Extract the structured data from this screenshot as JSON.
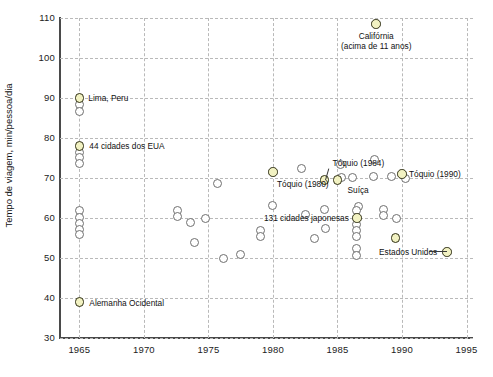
{
  "chart_data": {
    "type": "scatter",
    "title": "",
    "xlabel": "",
    "ylabel": "Tempo de viagem, min/pessoa/dia",
    "xlim": [
      1963.5,
      1995.5
    ],
    "ylim": [
      30,
      110
    ],
    "xticks": [
      1965,
      1970,
      1975,
      1980,
      1985,
      1990,
      1995
    ],
    "yticks": [
      30,
      40,
      50,
      60,
      70,
      80,
      90,
      100,
      110
    ],
    "grid": true,
    "legend": "none",
    "series": [
      {
        "name": "destacados",
        "marker": "circle-highlight",
        "color": "#f2f2c2",
        "edge_color": "#2f2f14",
        "points": [
          {
            "x": 1965.0,
            "y": 90.0,
            "label": "Lima, Peru"
          },
          {
            "x": 1965.0,
            "y": 78.0,
            "label": "44 cidades dos EUA"
          },
          {
            "x": 1965.0,
            "y": 39.0,
            "label": "Alemanha Ocidental"
          },
          {
            "x": 1988.0,
            "y": 108.5,
            "label": "Califórnia (acima de 11 anos)"
          },
          {
            "x": 1980.0,
            "y": 71.5,
            "label": "Tóquio (1980)"
          },
          {
            "x": 1984.0,
            "y": 69.5,
            "label": "Tóquio (1984)"
          },
          {
            "x": 1985.0,
            "y": 69.5,
            "label": "Suíça"
          },
          {
            "x": 1990.0,
            "y": 71.0,
            "label": "Tóquio (1990)"
          },
          {
            "x": 1986.5,
            "y": 60.0,
            "label": "131 cidades japonesas"
          },
          {
            "x": 1989.5,
            "y": 55.0,
            "label": ""
          },
          {
            "x": 1993.5,
            "y": 51.5,
            "label": "Estados Unidos"
          }
        ]
      },
      {
        "name": "demais",
        "marker": "circle-open",
        "color": "#ffffff",
        "edge_color": "#6f6f6f",
        "points": [
          {
            "x": 1965.0,
            "y": 88.3
          },
          {
            "x": 1965.0,
            "y": 86.7
          },
          {
            "x": 1965.0,
            "y": 76.5
          },
          {
            "x": 1965.0,
            "y": 75.2
          },
          {
            "x": 1965.0,
            "y": 73.6
          },
          {
            "x": 1965.0,
            "y": 61.8
          },
          {
            "x": 1965.0,
            "y": 60.2
          },
          {
            "x": 1965.0,
            "y": 58.7
          },
          {
            "x": 1965.0,
            "y": 57.2
          },
          {
            "x": 1965.0,
            "y": 55.8
          },
          {
            "x": 1972.6,
            "y": 61.9
          },
          {
            "x": 1972.6,
            "y": 60.5
          },
          {
            "x": 1973.6,
            "y": 59.0
          },
          {
            "x": 1974.8,
            "y": 59.8
          },
          {
            "x": 1973.9,
            "y": 54.0
          },
          {
            "x": 1975.7,
            "y": 68.7
          },
          {
            "x": 1976.2,
            "y": 50.0
          },
          {
            "x": 1977.5,
            "y": 51.0
          },
          {
            "x": 1979.0,
            "y": 57.0
          },
          {
            "x": 1979.0,
            "y": 55.5
          },
          {
            "x": 1980.0,
            "y": 63.2
          },
          {
            "x": 1982.2,
            "y": 72.5
          },
          {
            "x": 1982.5,
            "y": 60.8
          },
          {
            "x": 1984.0,
            "y": 62.2
          },
          {
            "x": 1984.1,
            "y": 57.3
          },
          {
            "x": 1983.2,
            "y": 54.8
          },
          {
            "x": 1985.3,
            "y": 70.2
          },
          {
            "x": 1986.2,
            "y": 70.2
          },
          {
            "x": 1985.2,
            "y": 73.3
          },
          {
            "x": 1986.6,
            "y": 63.0
          },
          {
            "x": 1986.5,
            "y": 62.0
          },
          {
            "x": 1986.5,
            "y": 58.4
          },
          {
            "x": 1986.5,
            "y": 57.0
          },
          {
            "x": 1986.5,
            "y": 55.5
          },
          {
            "x": 1986.5,
            "y": 52.3
          },
          {
            "x": 1986.5,
            "y": 50.6
          },
          {
            "x": 1987.8,
            "y": 70.3
          },
          {
            "x": 1987.9,
            "y": 74.7
          },
          {
            "x": 1988.6,
            "y": 62.2
          },
          {
            "x": 1988.6,
            "y": 60.6
          },
          {
            "x": 1989.6,
            "y": 60.0
          },
          {
            "x": 1990.3,
            "y": 70.0
          },
          {
            "x": 1989.2,
            "y": 70.3
          }
        ]
      }
    ],
    "annotations": [
      {
        "id": "lima",
        "text": "Lima, Peru"
      },
      {
        "id": "eua44",
        "text": "44 cidades dos EUA"
      },
      {
        "id": "alemanha",
        "text": "Alemanha Ocidental"
      },
      {
        "id": "california1",
        "text": "Califórnia"
      },
      {
        "id": "california2",
        "text": "(acima de 11 anos)"
      },
      {
        "id": "toquio1980",
        "text": "Tóquio (1980)"
      },
      {
        "id": "toquio1984",
        "text": "Tóquio (1984)"
      },
      {
        "id": "toquio1990",
        "text": "Tóquio (1990)"
      },
      {
        "id": "suica",
        "text": "Suíça"
      },
      {
        "id": "japonesas",
        "text": "131 cidades japonesas"
      },
      {
        "id": "eua",
        "text": "Estados Unidos"
      }
    ]
  },
  "axes": {
    "y_title": "Tempo de viagem, min/pessoa/dia",
    "y_labels": [
      "110",
      "100",
      "90",
      "80",
      "70",
      "60",
      "50",
      "40",
      "30"
    ],
    "x_labels": [
      "1965",
      "1970",
      "1975",
      "1980",
      "1985",
      "1990",
      "1995"
    ]
  },
  "edge_text": {
    "line1": " ",
    "line2": " ",
    "line3": " ",
    "line4": " "
  }
}
